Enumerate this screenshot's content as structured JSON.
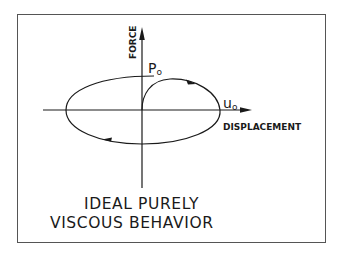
{
  "diagram": {
    "axes": {
      "y_label": "FORCE",
      "x_label": "DISPLACEMENT"
    },
    "annotations": {
      "peak_force": "P",
      "peak_force_sub": "o",
      "peak_disp": "u",
      "peak_disp_sub": "o"
    },
    "caption": {
      "line1": "IDEAL PURELY",
      "line2": "VISCOUS BEHAVIOR"
    },
    "colors": {
      "stroke": "#1a1a1a",
      "frame": "#555555",
      "background": "#ffffff"
    }
  }
}
